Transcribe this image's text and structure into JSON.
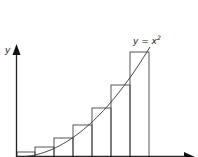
{
  "diagram": {
    "curve_label": "y = x",
    "curve_label_exp": "2",
    "y_axis_label": "y",
    "x_axis_label": "",
    "colors": {
      "stroke": "#333333",
      "background": "#ffffff"
    },
    "rectangles": [
      {
        "x0": 17,
        "x1": 35,
        "top": 152
      },
      {
        "x0": 35,
        "x1": 54,
        "top": 147
      },
      {
        "x0": 54,
        "x1": 73,
        "top": 138
      },
      {
        "x0": 73,
        "x1": 92,
        "top": 125
      },
      {
        "x0": 92,
        "x1": 111,
        "top": 108
      },
      {
        "x0": 111,
        "x1": 130,
        "top": 85
      },
      {
        "x0": 130,
        "x1": 149,
        "top": 52
      }
    ]
  }
}
